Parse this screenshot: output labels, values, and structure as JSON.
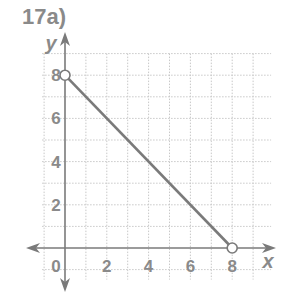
{
  "problem_label": "17a)",
  "chart_data": {
    "type": "line",
    "title": "17a)",
    "xlabel": "x",
    "ylabel": "y",
    "xlim": [
      -1,
      9
    ],
    "ylim": [
      -1,
      9
    ],
    "grid": true,
    "x_ticks": [
      "0",
      "2",
      "4",
      "6",
      "8"
    ],
    "y_ticks": [
      "2",
      "4",
      "6",
      "8"
    ],
    "series": [
      {
        "name": "segment",
        "points": [
          {
            "x": 0,
            "y": 8
          },
          {
            "x": 8,
            "y": 0
          }
        ],
        "endpoints": "open"
      }
    ],
    "colors": {
      "line": "#7a7a7a",
      "grid": "#c8c8c8",
      "text": "#8a8a8a"
    }
  }
}
